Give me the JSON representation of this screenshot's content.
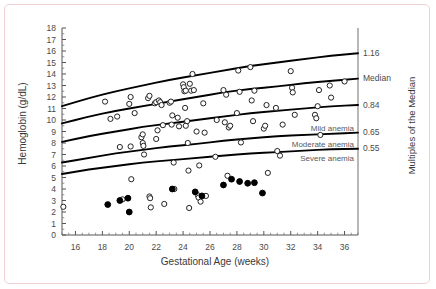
{
  "figure": {
    "border_color": "#f0cfd3",
    "background": "#ffffff"
  },
  "chart_data": {
    "type": "scatter",
    "title": "",
    "xlabel": "Gestational Age  (weeks)",
    "ylabel": "Hemoglobin (g/dL)",
    "right_axis_label": "Multiples of the Median",
    "xlim": [
      15,
      37
    ],
    "ylim": [
      0,
      18
    ],
    "grid": false,
    "legend": "none",
    "xticks": [
      16,
      18,
      20,
      22,
      24,
      26,
      28,
      30,
      32,
      34,
      36
    ],
    "yticks": [
      0,
      1,
      2,
      3,
      4,
      5,
      6,
      7,
      8,
      9,
      10,
      11,
      12,
      13,
      14,
      15,
      16,
      17,
      18
    ],
    "xtick_labels": [
      "16",
      "18",
      "20",
      "22",
      "24",
      "26",
      "28",
      "30",
      "32",
      "34",
      "36"
    ],
    "ytick_labels": [
      "0",
      "1",
      "2",
      "3",
      "4",
      "5",
      "6",
      "7",
      "8",
      "9",
      "10",
      "11",
      "12",
      "13",
      "14",
      "15",
      "16",
      "17",
      "18"
    ],
    "right_tick_labels": [
      "1.16",
      "Median",
      "0.84",
      "0.65",
      "0.55"
    ],
    "right_tick_values": [
      15.8,
      13.6,
      11.3,
      8.9,
      7.5
    ],
    "curve_annotations": [
      "Mild anemia",
      "Moderate anemia",
      "Severe anemia"
    ],
    "series": [
      {
        "name": "reference-curve-1.16",
        "type": "line",
        "mom": 1.16,
        "label": "1.16",
        "x": [
          15,
          17,
          19,
          21,
          23,
          25,
          27,
          29,
          31,
          33,
          35,
          37
        ],
        "y": [
          11.2,
          11.9,
          12.5,
          13.0,
          13.5,
          13.9,
          14.3,
          14.7,
          15.0,
          15.3,
          15.6,
          15.8
        ]
      },
      {
        "name": "reference-curve-median",
        "type": "line",
        "mom": 1.0,
        "label": "Median",
        "x": [
          15,
          17,
          19,
          21,
          23,
          25,
          27,
          29,
          31,
          33,
          35,
          37
        ],
        "y": [
          9.7,
          10.3,
          10.8,
          11.2,
          11.6,
          12.0,
          12.4,
          12.7,
          12.9,
          13.2,
          13.4,
          13.6
        ]
      },
      {
        "name": "reference-curve-0.84",
        "type": "line",
        "mom": 0.84,
        "label": "0.84",
        "x": [
          15,
          17,
          19,
          21,
          23,
          25,
          27,
          29,
          31,
          33,
          35,
          37
        ],
        "y": [
          8.1,
          8.6,
          9.0,
          9.4,
          9.7,
          10.0,
          10.3,
          10.6,
          10.8,
          11.0,
          11.2,
          11.3
        ]
      },
      {
        "name": "reference-curve-0.65-mild",
        "type": "line",
        "mom": 0.65,
        "label": "Mild anemia",
        "x": [
          15,
          17,
          19,
          21,
          23,
          25,
          27,
          29,
          31,
          33,
          35,
          37
        ],
        "y": [
          6.3,
          6.7,
          7.1,
          7.4,
          7.7,
          7.9,
          8.2,
          8.4,
          8.6,
          8.7,
          8.8,
          8.9
        ]
      },
      {
        "name": "reference-curve-0.55-moderate",
        "type": "line",
        "mom": 0.55,
        "label": "Moderate anemia",
        "x": [
          15,
          17,
          19,
          21,
          23,
          25,
          27,
          29,
          31,
          33,
          35,
          37
        ],
        "y": [
          5.3,
          5.7,
          6.0,
          6.3,
          6.5,
          6.7,
          6.9,
          7.1,
          7.2,
          7.35,
          7.45,
          7.5
        ]
      },
      {
        "name": "open-circles",
        "type": "scatter",
        "marker": "open-circle",
        "points": [
          [
            15.1,
            2.45
          ],
          [
            18.2,
            11.6
          ],
          [
            18.6,
            10.1
          ],
          [
            19.1,
            10.3
          ],
          [
            19.3,
            7.65
          ],
          [
            19.5,
            3.1
          ],
          [
            20.0,
            11.4
          ],
          [
            20.1,
            12.0
          ],
          [
            20.1,
            7.7
          ],
          [
            20.15,
            4.85
          ],
          [
            20.4,
            10.6
          ],
          [
            20.9,
            8.5
          ],
          [
            21.0,
            8.75
          ],
          [
            21.0,
            8.0
          ],
          [
            21.05,
            7.75
          ],
          [
            21.1,
            7.0
          ],
          [
            21.4,
            11.9
          ],
          [
            21.5,
            12.1
          ],
          [
            21.5,
            3.35
          ],
          [
            21.55,
            3.2
          ],
          [
            21.6,
            2.4
          ],
          [
            21.9,
            11.45
          ],
          [
            22.0,
            11.55
          ],
          [
            22.0,
            8.35
          ],
          [
            22.1,
            9.1
          ],
          [
            22.2,
            11.7
          ],
          [
            22.3,
            11.55
          ],
          [
            22.4,
            11.3
          ],
          [
            22.5,
            9.55
          ],
          [
            22.6,
            2.7
          ],
          [
            23.0,
            11.5
          ],
          [
            23.1,
            11.6
          ],
          [
            23.15,
            9.6
          ],
          [
            23.2,
            10.4
          ],
          [
            23.3,
            6.3
          ],
          [
            23.35,
            4.0
          ],
          [
            23.6,
            10.2
          ],
          [
            23.7,
            9.45
          ],
          [
            24.0,
            13.1
          ],
          [
            24.05,
            12.85
          ],
          [
            24.1,
            12.5
          ],
          [
            24.15,
            11.05
          ],
          [
            24.2,
            12.55
          ],
          [
            24.2,
            9.5
          ],
          [
            24.3,
            9.9
          ],
          [
            24.35,
            8.0
          ],
          [
            24.4,
            5.6
          ],
          [
            24.45,
            2.35
          ],
          [
            24.5,
            13.15
          ],
          [
            24.6,
            12.55
          ],
          [
            24.7,
            14.0
          ],
          [
            24.8,
            12.6
          ],
          [
            25.0,
            9.0
          ],
          [
            25.1,
            3.45
          ],
          [
            25.15,
            3.25
          ],
          [
            25.2,
            6.05
          ],
          [
            25.3,
            2.9
          ],
          [
            25.5,
            11.45
          ],
          [
            25.6,
            8.9
          ],
          [
            25.7,
            3.4
          ],
          [
            26.4,
            6.8
          ],
          [
            26.5,
            10.0
          ],
          [
            27.0,
            12.6
          ],
          [
            27.1,
            9.8
          ],
          [
            27.2,
            12.2
          ],
          [
            27.3,
            5.15
          ],
          [
            27.4,
            9.35
          ],
          [
            27.5,
            9.5
          ],
          [
            28.0,
            10.6
          ],
          [
            28.1,
            14.3
          ],
          [
            28.2,
            12.45
          ],
          [
            28.3,
            8.05
          ],
          [
            29.0,
            14.6
          ],
          [
            29.1,
            11.7
          ],
          [
            29.2,
            9.9
          ],
          [
            29.3,
            12.55
          ],
          [
            30.0,
            9.25
          ],
          [
            30.1,
            9.5
          ],
          [
            30.2,
            11.3
          ],
          [
            30.3,
            5.4
          ],
          [
            30.9,
            11.05
          ],
          [
            31.0,
            7.3
          ],
          [
            31.2,
            6.9
          ],
          [
            31.4,
            9.6
          ],
          [
            32.0,
            14.25
          ],
          [
            32.1,
            12.8
          ],
          [
            32.15,
            12.4
          ],
          [
            32.3,
            10.45
          ],
          [
            33.8,
            10.45
          ],
          [
            33.9,
            10.15
          ],
          [
            34.0,
            11.2
          ],
          [
            34.1,
            12.6
          ],
          [
            34.2,
            8.7
          ],
          [
            34.9,
            13.0
          ],
          [
            35.0,
            11.95
          ],
          [
            36.0,
            13.35
          ]
        ]
      },
      {
        "name": "filled-circles",
        "type": "scatter",
        "marker": "filled-circle",
        "points": [
          [
            18.4,
            2.65
          ],
          [
            19.3,
            3.0
          ],
          [
            19.9,
            3.2
          ],
          [
            20.0,
            2.0
          ],
          [
            23.2,
            4.0
          ],
          [
            24.9,
            3.75
          ],
          [
            25.4,
            3.4
          ],
          [
            27.0,
            4.35
          ],
          [
            27.6,
            4.85
          ],
          [
            28.2,
            4.65
          ],
          [
            28.8,
            4.5
          ],
          [
            29.3,
            4.55
          ],
          [
            29.9,
            3.65
          ]
        ]
      }
    ]
  }
}
